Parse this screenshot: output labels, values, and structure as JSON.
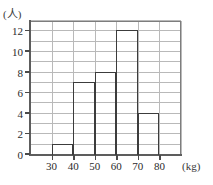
{
  "chart_data": {
    "type": "bar",
    "title": "",
    "subtitle": "",
    "xlabel": "(kg)",
    "ylabel": "(人)",
    "bin_edges": [
      30,
      40,
      50,
      60,
      70,
      80
    ],
    "categories": [
      "30–40",
      "40–50",
      "50–60",
      "60–70",
      "70–80"
    ],
    "values": [
      1,
      7,
      8,
      12,
      4
    ],
    "bars": [
      {
        "label": "30–40",
        "start": 30,
        "end": 40,
        "value": 1
      },
      {
        "label": "40–50",
        "start": 40,
        "end": 50,
        "value": 7
      },
      {
        "label": "50–60",
        "start": 50,
        "end": 60,
        "value": 8
      },
      {
        "label": "60–70",
        "start": 60,
        "end": 70,
        "value": 12
      },
      {
        "label": "70–80",
        "start": 70,
        "end": 80,
        "value": 4
      }
    ],
    "xlim": [
      20,
      90
    ],
    "ylim": [
      0,
      13
    ],
    "x_tick_values": [
      30,
      40,
      50,
      60,
      70,
      80
    ],
    "x_tick_labels": [
      "30",
      "40",
      "50",
      "60",
      "70",
      "80"
    ],
    "y_tick_values": [
      0,
      2,
      4,
      6,
      8,
      10,
      12
    ],
    "y_tick_labels": [
      "0",
      "2",
      "4",
      "6",
      "8",
      "10",
      "12"
    ],
    "y_gridline_step": 1,
    "x_gridline_step": 10,
    "grid": true,
    "legend": false,
    "legend_position": "none",
    "annotations": [],
    "colors": {
      "bar_outline": "#3c3c3c",
      "bar_fill": "transparent",
      "gridline": "#b9b9b9",
      "axis": "#5d5d5d",
      "text": "#2b2b2b",
      "background": "#ffffff"
    }
  }
}
